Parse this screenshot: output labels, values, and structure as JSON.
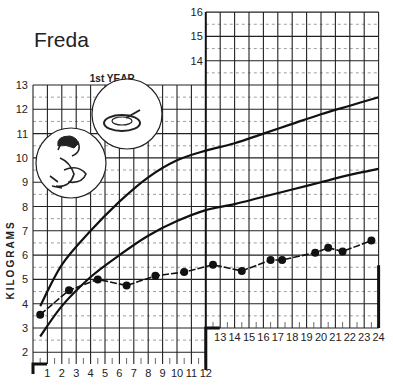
{
  "header": {
    "child_name": "Freda"
  },
  "chart_data": {
    "type": "line",
    "title": "Freda",
    "xlabel": "Months",
    "ylabel": "KILOGRAMS",
    "section_label": "1st YEAR",
    "x_ticks": [
      "1",
      "2",
      "3",
      "4",
      "5",
      "6",
      "7",
      "8",
      "9",
      "10",
      "11",
      "12",
      "13",
      "14",
      "15",
      "16",
      "17",
      "18",
      "19",
      "20",
      "21",
      "22",
      "23",
      "24"
    ],
    "y_ticks_left": [
      "2",
      "3",
      "4",
      "5",
      "6",
      "7",
      "8",
      "9",
      "10",
      "11",
      "12",
      "13"
    ],
    "y_ticks_right": [
      "14",
      "15",
      "16"
    ],
    "xlim": [
      0,
      24
    ],
    "ylim": [
      1.5,
      16
    ],
    "grid": true,
    "series": [
      {
        "name": "Upper reference curve",
        "x": [
          0.5,
          2,
          4,
          6,
          8,
          10,
          12,
          14,
          16,
          18,
          20,
          22,
          24
        ],
        "y": [
          3.9,
          5.6,
          7.0,
          8.2,
          9.2,
          9.9,
          10.3,
          10.6,
          11.0,
          11.4,
          11.8,
          12.15,
          12.5
        ]
      },
      {
        "name": "Lower reference curve",
        "x": [
          0.5,
          2,
          4,
          6,
          8,
          10,
          12,
          14,
          16,
          18,
          20,
          22,
          24
        ],
        "y": [
          2.65,
          3.9,
          5.1,
          6.0,
          6.8,
          7.4,
          7.85,
          8.1,
          8.4,
          8.7,
          9.0,
          9.3,
          9.55
        ]
      },
      {
        "name": "Freda's weight",
        "x": [
          0.5,
          2.5,
          4.5,
          6.5,
          8.5,
          10.5,
          12.5,
          14.5,
          16.5,
          17.3,
          19.6,
          20.5,
          21.5,
          23.5
        ],
        "y": [
          3.55,
          4.55,
          5.0,
          4.75,
          5.15,
          5.3,
          5.6,
          5.35,
          5.8,
          5.8,
          6.1,
          6.3,
          6.15,
          6.6
        ]
      }
    ],
    "annotations": [
      "1st YEAR",
      "illustration: mother breastfeeding baby",
      "illustration: bowl with spoon"
    ]
  }
}
